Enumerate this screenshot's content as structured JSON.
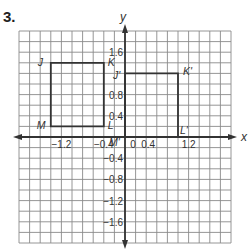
{
  "problem_number": "3.",
  "axes": {
    "x_label": "x",
    "y_label": "y",
    "x_ticks": [
      "−1.2",
      "−0.4",
      "0",
      "0.4",
      "1.2"
    ],
    "y_ticks": [
      "1.6",
      "0.8",
      "0.4",
      "−0.4",
      "−0.8",
      "−1.2",
      "−1.6"
    ],
    "grid_step": 0.2,
    "range": [
      -2.0,
      2.0
    ]
  },
  "figures": {
    "original": {
      "name": "JKLM",
      "vertices": [
        {
          "label": "J",
          "x": -1.4,
          "y": 1.4
        },
        {
          "label": "K",
          "x": -0.4,
          "y": 1.4
        },
        {
          "label": "L",
          "x": -0.4,
          "y": 0.2
        },
        {
          "label": "M",
          "x": -1.4,
          "y": 0.2
        }
      ]
    },
    "image": {
      "name": "J'K'L'M'",
      "vertices": [
        {
          "label": "J'",
          "x": 0.0,
          "y": 1.2
        },
        {
          "label": "K'",
          "x": 1.0,
          "y": 1.2
        },
        {
          "label": "L'",
          "x": 1.0,
          "y": 0.0
        },
        {
          "label": "M'",
          "x": 0.0,
          "y": 0.0
        }
      ]
    }
  },
  "colors": {
    "grid": "#8a8a8a",
    "axis": "#333333",
    "shape": "#333333"
  }
}
